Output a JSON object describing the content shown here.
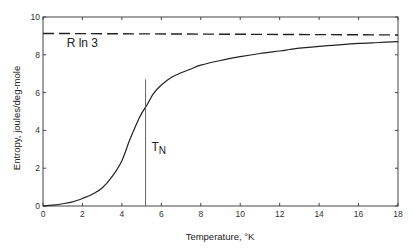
{
  "chart_data": {
    "type": "line",
    "title": "",
    "xlabel": "Temperature, °K",
    "ylabel": "Entropy, joules/deg-mole",
    "xlim": [
      0,
      18
    ],
    "ylim": [
      0,
      10
    ],
    "xticks": [
      0,
      2,
      4,
      6,
      8,
      10,
      12,
      14,
      16,
      18
    ],
    "yticks": [
      0,
      2,
      4,
      6,
      8,
      10
    ],
    "xtick_labels": [
      "0",
      "2",
      "4",
      "6",
      "8",
      "10",
      "12",
      "14",
      "16",
      "18"
    ],
    "ytick_labels": [
      "0",
      "2",
      "4",
      "6",
      "8",
      "10"
    ],
    "grid": false,
    "legend": null,
    "series": [
      {
        "name": "Entropy",
        "style": "solid",
        "x": [
          0,
          0.5,
          1,
          1.5,
          2,
          2.5,
          3,
          3.5,
          4,
          4.4,
          4.9,
          5.3,
          5.6,
          6,
          6.5,
          7,
          7.5,
          8,
          9,
          10,
          11,
          12,
          12.5,
          13,
          14,
          15,
          16,
          17,
          18
        ],
        "y": [
          0,
          0.05,
          0.12,
          0.22,
          0.4,
          0.62,
          0.95,
          1.55,
          2.4,
          3.5,
          4.7,
          5.4,
          5.95,
          6.4,
          6.8,
          7.05,
          7.25,
          7.45,
          7.7,
          7.9,
          8.07,
          8.2,
          8.28,
          8.35,
          8.45,
          8.53,
          8.6,
          8.65,
          8.7
        ]
      },
      {
        "name": "R ln 3",
        "style": "dashed",
        "x": [
          0,
          18
        ],
        "y": [
          9.13,
          9.05
        ]
      }
    ],
    "annotations": [
      {
        "text": "R ln 3",
        "x": 1.2,
        "y": 8.4
      },
      {
        "text": "T",
        "subscript": "N",
        "x": 5.5,
        "y": 2.9
      }
    ],
    "reference_lines": [
      {
        "name": "T_N",
        "orientation": "vertical",
        "x": 5.2,
        "y_from": 0,
        "y_to": 6.7
      }
    ]
  }
}
